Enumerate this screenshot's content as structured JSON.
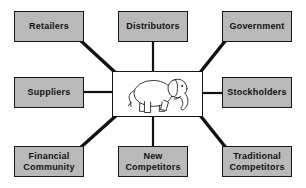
{
  "diagram": {
    "type": "hub-and-spoke",
    "center": {
      "icon": "elephant-icon",
      "label": ""
    },
    "nodes": [
      {
        "id": "retailers",
        "label": "Retailers"
      },
      {
        "id": "distributors",
        "label": "Distributors"
      },
      {
        "id": "government",
        "label": "Government"
      },
      {
        "id": "suppliers",
        "label": "Suppliers"
      },
      {
        "id": "stockholders",
        "label": "Stockholders"
      },
      {
        "id": "financial-community",
        "label": "Financial\nCommunity"
      },
      {
        "id": "new-competitors",
        "label": "New\nCompetitors"
      },
      {
        "id": "traditional-competitors",
        "label": "Traditional\nCompetitors"
      }
    ],
    "connections": [
      {
        "from": "center",
        "to": "retailers"
      },
      {
        "from": "center",
        "to": "distributors"
      },
      {
        "from": "center",
        "to": "government"
      },
      {
        "from": "center",
        "to": "suppliers"
      },
      {
        "from": "center",
        "to": "stockholders"
      },
      {
        "from": "center",
        "to": "financial-community"
      },
      {
        "from": "center",
        "to": "new-competitors"
      },
      {
        "from": "center",
        "to": "traditional-competitors"
      }
    ],
    "colors": {
      "node_fill": "#b9b9b9",
      "node_border": "#161616",
      "connector": "#111111",
      "center_fill": "#ffffff",
      "background": "#ffffff"
    }
  }
}
